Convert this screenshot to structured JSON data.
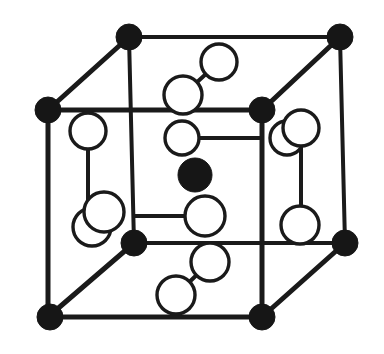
{
  "figure": {
    "type": "ball-and-stick unit cell",
    "background_color": "#ffffff",
    "line_color": "#1a1a1a",
    "filled_atom_color": "#161616",
    "open_atom_fill": "#ffffff",
    "canvas": {
      "width": 384,
      "height": 354
    }
  },
  "legend": {
    "filled_atom_label": "filled circle atom",
    "open_atom_label": "open circle atom"
  },
  "geometry": {
    "cube_vertices": {
      "front_top_left": {
        "x": 48,
        "y": 110
      },
      "front_top_right": {
        "x": 262,
        "y": 110
      },
      "front_bottom_left": {
        "x": 48,
        "y": 317
      },
      "front_bottom_right": {
        "x": 262,
        "y": 317
      },
      "back_top_left": {
        "x": 129,
        "y": 37
      },
      "back_top_right": {
        "x": 340,
        "y": 37
      },
      "back_bottom_left": {
        "x": 134,
        "y": 243
      },
      "back_bottom_right": {
        "x": 345,
        "y": 243
      }
    }
  },
  "edges": [
    {
      "name": "edge-front-top",
      "from": "front_top_left",
      "to": "front_top_right",
      "width": 5
    },
    {
      "name": "edge-front-left",
      "from": "front_top_left",
      "to": "front_bottom_left",
      "width": 5
    },
    {
      "name": "edge-front-bottom",
      "from": "front_bottom_left",
      "to": "front_bottom_right",
      "width": 5
    },
    {
      "name": "edge-front-right",
      "from": "front_top_right",
      "to": "front_bottom_right",
      "width": 5
    },
    {
      "name": "edge-back-top",
      "from": "back_top_left",
      "to": "back_top_right",
      "width": 4
    },
    {
      "name": "edge-back-left",
      "from": "back_top_left",
      "to": "back_bottom_left",
      "width": 4
    },
    {
      "name": "edge-back-bottom",
      "from": "back_bottom_left",
      "to": "back_bottom_right",
      "width": 4
    },
    {
      "name": "edge-back-right",
      "from": "back_top_right",
      "to": "back_bottom_right",
      "width": 4
    },
    {
      "name": "edge-diag-top-left",
      "from": "front_top_left",
      "to": "back_top_left",
      "width": 5
    },
    {
      "name": "edge-diag-top-right",
      "from": "front_top_right",
      "to": "back_top_right",
      "width": 5
    },
    {
      "name": "edge-diag-bottom-left",
      "from": "front_bottom_left",
      "to": "back_bottom_left",
      "width": 5
    },
    {
      "name": "edge-diag-bottom-right",
      "from": "front_bottom_right",
      "to": "back_bottom_right",
      "width": 5
    }
  ],
  "atoms": {
    "filled": [
      {
        "name": "corner-back-top-left",
        "cx": 129,
        "cy": 37,
        "r": 13
      },
      {
        "name": "corner-back-top-right",
        "cx": 340,
        "cy": 37,
        "r": 13
      },
      {
        "name": "corner-front-top-left",
        "cx": 48,
        "cy": 110,
        "r": 13
      },
      {
        "name": "corner-front-top-right",
        "cx": 262,
        "cy": 110,
        "r": 13
      },
      {
        "name": "corner-back-bottom-left",
        "cx": 134,
        "cy": 243,
        "r": 13
      },
      {
        "name": "corner-back-bottom-right",
        "cx": 345,
        "cy": 243,
        "r": 13
      },
      {
        "name": "corner-front-bottom-left",
        "cx": 50,
        "cy": 317,
        "r": 13
      },
      {
        "name": "corner-front-bottom-right",
        "cx": 262,
        "cy": 317,
        "r": 13
      },
      {
        "name": "body-center-atom",
        "cx": 195,
        "cy": 175,
        "r": 17
      }
    ],
    "open": [
      {
        "name": "open-atom-top-upper",
        "cx": 219,
        "cy": 62,
        "r": 18
      },
      {
        "name": "open-atom-top-lower",
        "cx": 183,
        "cy": 95,
        "r": 19
      },
      {
        "name": "open-atom-left-upper",
        "cx": 88,
        "cy": 131,
        "r": 18
      },
      {
        "name": "open-atom-right-upper-back",
        "cx": 287,
        "cy": 138,
        "r": 17
      },
      {
        "name": "open-atom-right-upper",
        "cx": 301,
        "cy": 128,
        "r": 18
      },
      {
        "name": "open-atom-inner-left",
        "cx": 182,
        "cy": 138,
        "r": 17
      },
      {
        "name": "open-atom-left-lower-back",
        "cx": 92,
        "cy": 227,
        "r": 19
      },
      {
        "name": "open-atom-left-lower",
        "cx": 104,
        "cy": 212,
        "r": 20
      },
      {
        "name": "open-atom-inner-lower",
        "cx": 205,
        "cy": 216,
        "r": 20
      },
      {
        "name": "open-atom-right-lower",
        "cx": 300,
        "cy": 225,
        "r": 19
      },
      {
        "name": "open-atom-bottom-upper",
        "cx": 210,
        "cy": 262,
        "r": 19
      },
      {
        "name": "open-atom-bottom-lower",
        "cx": 176,
        "cy": 295,
        "r": 19
      }
    ]
  },
  "bonds": [
    {
      "name": "bond-top-pair",
      "x1": 219,
      "y1": 62,
      "x2": 183,
      "y2": 95,
      "width": 4
    },
    {
      "name": "bond-left-upper-stem",
      "x1": 88,
      "y1": 131,
      "x2": 88,
      "y2": 208,
      "width": 4
    },
    {
      "name": "bond-inner-left-right",
      "x1": 182,
      "y1": 138,
      "x2": 262,
      "y2": 138,
      "width": 4
    },
    {
      "name": "bond-right-upper-stem",
      "x1": 301,
      "y1": 128,
      "x2": 301,
      "y2": 222,
      "width": 4
    },
    {
      "name": "bond-inner-lower-left",
      "x1": 205,
      "y1": 216,
      "x2": 134,
      "y2": 216,
      "width": 4
    },
    {
      "name": "bond-bottom-pair",
      "x1": 210,
      "y1": 262,
      "x2": 176,
      "y2": 295,
      "width": 4
    }
  ]
}
